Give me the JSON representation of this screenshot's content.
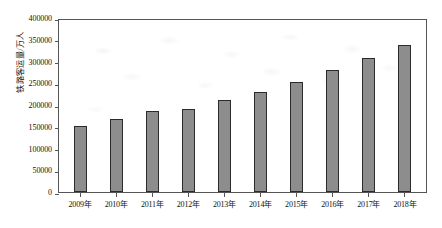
{
  "chart_data": {
    "type": "bar",
    "title": "",
    "xlabel": "",
    "ylabel": "铁路客运量/万人",
    "categories": [
      "2009年",
      "2010年",
      "2011年",
      "2012年",
      "2013年",
      "2014年",
      "2015年",
      "2016年",
      "2017年",
      "2018年"
    ],
    "values": [
      152000,
      167000,
      186000,
      190000,
      211000,
      230000,
      253000,
      281000,
      308000,
      337000
    ],
    "ylim": [
      0,
      400000
    ],
    "ytick_labels": [
      "400000",
      "350000",
      "300000",
      "250000",
      "200000",
      "150000",
      "100000",
      "50000",
      "0"
    ],
    "ytick_values": [
      400000,
      350000,
      300000,
      250000,
      200000,
      150000,
      100000,
      50000,
      0
    ],
    "grid": false,
    "legend": "none",
    "series_color": "#8d8d8d",
    "bar_edge_color": "#2b2b2b",
    "axis_color": "#555555"
  }
}
